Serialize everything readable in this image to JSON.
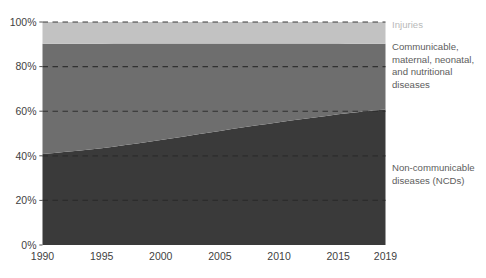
{
  "chart_data": {
    "type": "area",
    "title": "",
    "subtitle": "",
    "xlabel": "",
    "ylabel": "",
    "stacked": true,
    "stack_normalized": true,
    "grid": true,
    "grid_style": "dashed-horizontal",
    "legend_position": "right-annotations",
    "xlim": [
      1990,
      2019
    ],
    "ylim": [
      0,
      100
    ],
    "x": [
      1990,
      1991,
      1992,
      1993,
      1994,
      1995,
      1996,
      1997,
      1998,
      1999,
      2000,
      2001,
      2002,
      2003,
      2004,
      2005,
      2006,
      2007,
      2008,
      2009,
      2010,
      2011,
      2012,
      2013,
      2014,
      2015,
      2016,
      2017,
      2018,
      2019
    ],
    "xticks": [
      1990,
      1995,
      2000,
      2005,
      2010,
      2015,
      2019
    ],
    "xtick_labels": [
      "1990",
      "1995",
      "2000",
      "2005",
      "2010",
      "2015",
      "2019"
    ],
    "yticks": [
      0,
      20,
      40,
      60,
      80,
      100
    ],
    "ytick_labels": [
      "0%",
      "20%",
      "40%",
      "60%",
      "80%",
      "100%"
    ],
    "series": [
      {
        "name": "Non-communicable diseases (NCDs)",
        "short_name": "NCDs",
        "color": "#3a3a3a",
        "values": [
          40.8,
          41.3,
          41.8,
          42.3,
          42.8,
          43.4,
          44.1,
          44.8,
          45.5,
          46.3,
          47.1,
          47.9,
          48.7,
          49.5,
          50.3,
          51.1,
          52.0,
          52.8,
          53.6,
          54.3,
          55.0,
          55.8,
          56.5,
          57.2,
          57.9,
          58.6,
          59.2,
          59.8,
          60.3,
          60.8
        ]
      },
      {
        "name": "Communicable, maternal, neonatal, and nutritional diseases",
        "short_name": "CMNN",
        "color": "#6e6e6e",
        "values": [
          49.4,
          48.9,
          48.4,
          48.0,
          47.5,
          46.9,
          46.3,
          45.6,
          44.9,
          44.1,
          43.3,
          42.5,
          41.7,
          40.9,
          40.1,
          39.3,
          38.4,
          37.6,
          36.8,
          36.1,
          35.4,
          34.6,
          33.9,
          33.2,
          32.5,
          31.8,
          31.1,
          30.5,
          30.0,
          29.5
        ]
      },
      {
        "name": "Injuries",
        "short_name": "Injuries",
        "color": "#c2c2c2",
        "values": [
          9.8,
          9.8,
          9.8,
          9.7,
          9.7,
          9.7,
          9.6,
          9.6,
          9.6,
          9.6,
          9.6,
          9.6,
          9.6,
          9.6,
          9.6,
          9.6,
          9.6,
          9.6,
          9.6,
          9.6,
          9.6,
          9.6,
          9.6,
          9.6,
          9.6,
          9.6,
          9.7,
          9.7,
          9.7,
          9.7
        ]
      }
    ],
    "annotations": [
      {
        "id": "injuries",
        "text": "Injuries",
        "lines": [
          "Injuries"
        ],
        "color": "#b9b9b9"
      },
      {
        "id": "cmnn",
        "text": "Communicable, maternal, neonatal, and nutritional diseases",
        "lines": [
          "Communicable,",
          "maternal, neonatal,",
          "and nutritional",
          "diseases"
        ],
        "color": "#5d5d5d"
      },
      {
        "id": "ncd",
        "text": "Non-communicable diseases (NCDs)",
        "lines": [
          "Non-communicable",
          "diseases (NCDs)"
        ],
        "color": "#5d5d5d"
      }
    ],
    "colors": {
      "background": "#ffffff",
      "ncd": "#3a3a3a",
      "cmnn": "#6e6e6e",
      "injuries": "#c2c2c2",
      "gridline": "#2b2b2b",
      "tick_text": "#3f3f3f"
    }
  }
}
